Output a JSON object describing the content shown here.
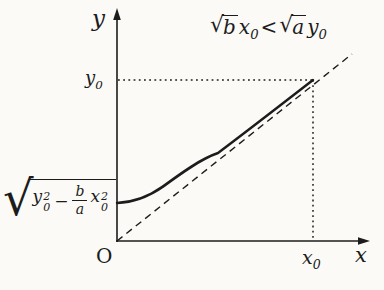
{
  "palette": {
    "ink": "#1c1c1c",
    "paper": "#fbfaf7"
  },
  "condition": {
    "radical1_sign": "√",
    "radical1_arg": "b",
    "var1_base": "x",
    "var1_sub": "0",
    "relation": "<",
    "radical2_sign": "√",
    "radical2_arg": "a",
    "var2_base": "y",
    "var2_sub": "0"
  },
  "axes": {
    "y_axis_label": "y",
    "x_axis_label": "x",
    "origin_label": "O"
  },
  "marks": {
    "y0_base": "y",
    "y0_sub": "0",
    "x0_base": "x",
    "x0_sub": "0"
  },
  "intercept_label": {
    "radical_sign": "√",
    "term1_base": "y",
    "term1_sup": "2",
    "term1_sub": "0",
    "operator": "−",
    "frac_numerator": "b",
    "frac_denominator": "a",
    "term2_base": "x",
    "term2_sup": "2",
    "term2_sub": "0"
  }
}
